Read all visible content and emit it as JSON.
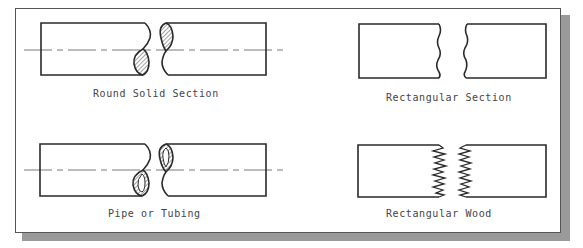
{
  "figure": {
    "panels": [
      {
        "id": "round-solid",
        "label": "Round Solid Section"
      },
      {
        "id": "rectangular",
        "label": "Rectangular Section"
      },
      {
        "id": "pipe",
        "label": "Pipe or Tubing"
      },
      {
        "id": "wood",
        "label": "Rectangular Wood"
      }
    ],
    "colors": {
      "line": "#2a2a2a",
      "centerline": "#555555",
      "hatch": "#444444",
      "shadow": "#9a9a9a",
      "background": "#ffffff"
    }
  }
}
